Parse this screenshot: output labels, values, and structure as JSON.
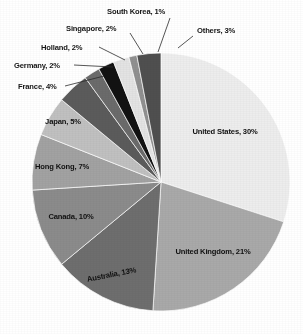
{
  "chart_data": {
    "type": "pie",
    "title": "",
    "xlabel": "",
    "ylabel": "",
    "unit": "%",
    "legend_position": "none",
    "grid": false,
    "start_angle_deg": 0,
    "direction": "clockwise",
    "categories": [
      "United States",
      "United Kingdom",
      "Australia",
      "Canada",
      "Hong Kong",
      "Japan",
      "France",
      "Germany",
      "Holland",
      "Singapore",
      "South Korea",
      "Others"
    ],
    "values": [
      30,
      21,
      13,
      10,
      7,
      5,
      4,
      2,
      2,
      2,
      1,
      3
    ],
    "slices": [
      {
        "label": "United States",
        "value": 30,
        "text": "United States, 30%",
        "color": "#ededed",
        "label_placement": "inside"
      },
      {
        "label": "United Kingdom",
        "value": 21,
        "text": "United Kingdom, 21%",
        "color": "#a9a9a9",
        "label_placement": "inside"
      },
      {
        "label": "Australia",
        "value": 13,
        "text": "Australia, 13%",
        "color": "#6e6e6e",
        "label_placement": "inside"
      },
      {
        "label": "Canada",
        "value": 10,
        "text": "Canada, 10%",
        "color": "#8b8b8b",
        "label_placement": "inside"
      },
      {
        "label": "Hong Kong",
        "value": 7,
        "text": "Hong Kong, 7%",
        "color": "#a2a2a2",
        "label_placement": "inside"
      },
      {
        "label": "Japan",
        "value": 5,
        "text": "Japan, 5%",
        "color": "#c0c0c0",
        "label_placement": "inside"
      },
      {
        "label": "France",
        "value": 4,
        "text": "France, 4%",
        "color": "#5b5b5b",
        "label_placement": "callout"
      },
      {
        "label": "Germany",
        "value": 2,
        "text": "Germany, 2%",
        "color": "#6b6b6b",
        "label_placement": "callout"
      },
      {
        "label": "Holland",
        "value": 2,
        "text": "Holland, 2%",
        "color": "#121212",
        "label_placement": "callout"
      },
      {
        "label": "Singapore",
        "value": 2,
        "text": "Singapore, 2%",
        "color": "#e3e3e3",
        "label_placement": "callout"
      },
      {
        "label": "South Korea",
        "value": 1,
        "text": "South Korea, 1%",
        "color": "#909090",
        "label_placement": "callout"
      },
      {
        "label": "Others",
        "value": 3,
        "text": "Others, 3%",
        "color": "#4f4f4f",
        "label_placement": "callout"
      }
    ],
    "inside_labels": [
      {
        "name": "united-states",
        "text": "United States, 30%",
        "x": 225,
        "y": 134,
        "anchor": "middle",
        "rotate": 0
      },
      {
        "name": "united-kingdom",
        "text": "United Kingdom, 21%",
        "x": 213,
        "y": 254,
        "anchor": "middle",
        "rotate": 0
      },
      {
        "name": "australia",
        "text": "Australia, 13%",
        "x": 112,
        "y": 277,
        "anchor": "middle",
        "rotate": -11
      },
      {
        "name": "canada",
        "text": "Canada, 10%",
        "x": 71,
        "y": 219,
        "anchor": "middle",
        "rotate": 0
      },
      {
        "name": "hong-kong",
        "text": "Hong Kong, 7%",
        "x": 62,
        "y": 169,
        "anchor": "middle",
        "rotate": 0
      },
      {
        "name": "japan",
        "text": "Japan, 5%",
        "x": 63,
        "y": 124,
        "anchor": "middle",
        "rotate": 0
      }
    ],
    "callout_labels": [
      {
        "name": "others",
        "text": "Others, 3%",
        "x": 197,
        "y": 33,
        "anchor": "start",
        "line": [
          [
            193,
            36
          ],
          [
            178,
            48
          ]
        ]
      },
      {
        "name": "south-korea",
        "text": "South Korea, 1%",
        "x": 107,
        "y": 14,
        "anchor": "start",
        "line": [
          [
            170,
            18
          ],
          [
            158,
            52
          ]
        ]
      },
      {
        "name": "singapore",
        "text": "Singapore, 2%",
        "x": 66,
        "y": 31,
        "anchor": "start",
        "line": [
          [
            130,
            33
          ],
          [
            143,
            54
          ]
        ]
      },
      {
        "name": "holland",
        "text": "Holland, 2%",
        "x": 41,
        "y": 50,
        "anchor": "start",
        "line": [
          [
            99,
            47
          ],
          [
            125,
            60
          ]
        ]
      },
      {
        "name": "germany",
        "text": "Germany, 2%",
        "x": 14,
        "y": 68,
        "anchor": "start",
        "line": [
          [
            74,
            65
          ],
          [
            113,
            67
          ]
        ]
      },
      {
        "name": "france",
        "text": "France, 4%",
        "x": 18,
        "y": 89,
        "anchor": "start",
        "line": [
          [
            65,
            86
          ],
          [
            104,
            76
          ]
        ]
      }
    ]
  },
  "geometry": {
    "cx": 161,
    "cy": 182,
    "r": 129
  }
}
